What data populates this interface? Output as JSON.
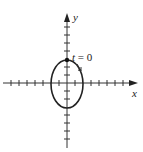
{
  "diagram": {
    "type": "parametric-ellipse",
    "x_axis_label": "x",
    "y_axis_label": "y",
    "start_label_var": "t",
    "start_label_rest": " = 0",
    "direction": "clockwise",
    "colors": {
      "stroke": "#222222",
      "background": "#ffffff"
    }
  }
}
